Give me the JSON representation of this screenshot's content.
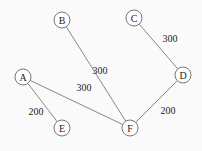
{
  "graph": {
    "nodes": [
      {
        "id": "A",
        "label": "A",
        "x": 23,
        "y": 77
      },
      {
        "id": "B",
        "label": "B",
        "x": 62,
        "y": 20
      },
      {
        "id": "C",
        "label": "C",
        "x": 134,
        "y": 18
      },
      {
        "id": "D",
        "label": "D",
        "x": 183,
        "y": 75
      },
      {
        "id": "E",
        "label": "E",
        "x": 62,
        "y": 128
      },
      {
        "id": "F",
        "label": "F",
        "x": 130,
        "y": 128
      }
    ],
    "edges": [
      {
        "from": "B",
        "to": "F",
        "weight": "300",
        "lx": 100,
        "ly": 70
      },
      {
        "from": "A",
        "to": "F",
        "weight": "300",
        "lx": 84,
        "ly": 87
      },
      {
        "from": "C",
        "to": "D",
        "weight": "300",
        "lx": 170,
        "ly": 38
      },
      {
        "from": "A",
        "to": "E",
        "weight": "200",
        "lx": 36,
        "ly": 111
      },
      {
        "from": "D",
        "to": "F",
        "weight": "200",
        "lx": 168,
        "ly": 110
      }
    ],
    "colors": {
      "node_stroke": "#777777",
      "edge": "#888888",
      "text": "#222222"
    }
  }
}
